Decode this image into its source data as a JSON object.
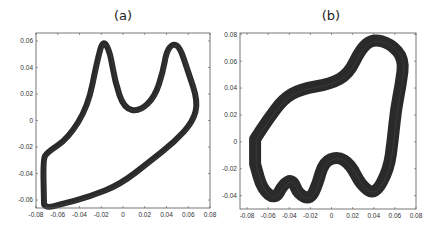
{
  "chart_data": [
    {
      "type": "line",
      "title": "(a)",
      "xlabel": "",
      "ylabel": "",
      "xlim": [
        -0.08,
        0.08
      ],
      "ylim": [
        -0.066,
        0.066
      ],
      "xticks": [
        "-0.08",
        "-0.06",
        "-0.04",
        "-0.02",
        "0",
        "0.02",
        "0.04",
        "0.06",
        "0.08"
      ],
      "yticks": [
        "0.06",
        "0.04",
        "0.02",
        "0",
        "-0.02",
        "-0.04",
        "-0.06"
      ],
      "grid": false,
      "legend": null,
      "stroke_color": "#2a2a2a",
      "stroke_width": 6,
      "series": [
        {
          "name": "trajectory",
          "x": [
            -0.0726,
            -0.0735,
            -0.0699,
            -0.0506,
            -0.0322,
            -0.0239,
            -0.0184,
            -0.012,
            -0.0074,
            0.0009,
            0.0156,
            0.0294,
            0.0368,
            0.04,
            0.046,
            0.0524,
            0.0598,
            0.069,
            0.0644,
            0.0478,
            0.0248,
            -0.0028,
            -0.0303,
            -0.0579,
            -0.069,
            -0.0726
          ],
          "y": [
            -0.0634,
            -0.0294,
            -0.0242,
            -0.0136,
            0.0106,
            0.0445,
            0.0611,
            0.0521,
            0.0294,
            0.0091,
            0.0068,
            0.0181,
            0.037,
            0.0521,
            0.0581,
            0.0551,
            0.037,
            0.0143,
            -0.0008,
            -0.0158,
            -0.0309,
            -0.0483,
            -0.0574,
            -0.0634,
            -0.0657,
            -0.0634
          ]
        }
      ]
    },
    {
      "type": "line",
      "title": "(b)",
      "xlabel": "",
      "ylabel": "",
      "xlim": [
        -0.0867,
        0.08
      ],
      "ylim": [
        -0.05,
        0.081
      ],
      "xticks": [
        "-0.08",
        "-0.06",
        "-0.04",
        "-0.02",
        "0",
        "0.02",
        "0.04",
        "0.06",
        "0.08"
      ],
      "yticks": [
        "0.08",
        "0.06",
        "0.04",
        "0.02",
        "0",
        "-0.02",
        "-0.04"
      ],
      "grid": false,
      "legend": null,
      "stroke_color": "#2a2a2a",
      "stroke_width": 12,
      "series": [
        {
          "name": "trajectory",
          "x": [
            -0.0724,
            -0.06,
            -0.0457,
            -0.0295,
            -0.001,
            0.0162,
            0.0276,
            0.039,
            0.0562,
            0.0686,
            0.0657,
            0.061,
            0.0581,
            0.0543,
            0.041,
            0.0276,
            0.0181,
            0.0057,
            -0.0076,
            -0.0133,
            -0.02,
            -0.0314,
            -0.0371,
            -0.0457,
            -0.0533,
            -0.0657,
            -0.0724
          ],
          "y": [
            0.002,
            0.0169,
            0.0319,
            0.0393,
            0.0431,
            0.0505,
            0.0692,
            0.0767,
            0.0729,
            0.0617,
            0.0431,
            0.0244,
            0.002,
            -0.0204,
            -0.0398,
            -0.0319,
            -0.0169,
            -0.0107,
            -0.0152,
            -0.0316,
            -0.0428,
            -0.0391,
            -0.0279,
            -0.0316,
            -0.0428,
            -0.0354,
            -0.0166
          ]
        }
      ]
    }
  ],
  "panels": {
    "a": {
      "label": "(a)"
    },
    "b": {
      "label": "(b)"
    }
  }
}
